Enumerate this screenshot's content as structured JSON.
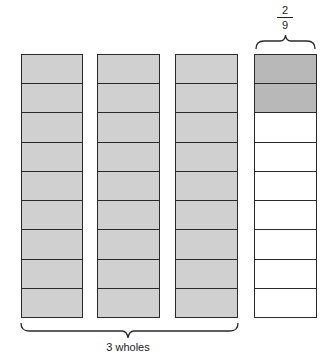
{
  "diagram": {
    "columns": [
      {
        "name": "whole-1",
        "left": 21,
        "width": 62,
        "cells": [
          "shaded",
          "shaded",
          "shaded",
          "shaded",
          "shaded",
          "shaded",
          "shaded",
          "shaded",
          "shaded"
        ]
      },
      {
        "name": "whole-2",
        "left": 97,
        "width": 63,
        "cells": [
          "shaded",
          "shaded",
          "shaded",
          "shaded",
          "shaded",
          "shaded",
          "shaded",
          "shaded",
          "shaded"
        ]
      },
      {
        "name": "whole-3",
        "left": 175,
        "width": 63,
        "cells": [
          "shaded",
          "shaded",
          "shaded",
          "shaded",
          "shaded",
          "shaded",
          "shaded",
          "shaded",
          "shaded"
        ]
      },
      {
        "name": "fraction",
        "left": 254,
        "width": 63,
        "cells": [
          "dark",
          "dark",
          "blank",
          "blank",
          "blank",
          "blank",
          "blank",
          "blank",
          "blank"
        ]
      }
    ],
    "wholes_label": "3 wholes",
    "fraction": {
      "numerator": "2",
      "denominator": "9"
    },
    "colors": {
      "shaded": "#d0d0d0",
      "dark": "#b8b8b8",
      "blank": "#ffffff",
      "stroke": "#2a2a2a"
    }
  }
}
